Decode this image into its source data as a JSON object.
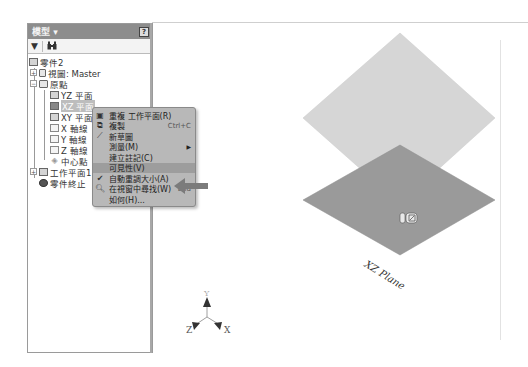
{
  "panel": {
    "title": "模型 ▾",
    "help_icon": "?",
    "toolbar": {
      "filter_icon": "▼",
      "search_icon": "binoculars"
    }
  },
  "tree": {
    "root": "零件2",
    "view": "視圖: Master",
    "origin": "原點",
    "yz_plane": "YZ 平面",
    "xz_plane": "XZ 平面",
    "xy_plane": "XY 平面",
    "x_axis": "X 軸線",
    "y_axis": "Y 軸線",
    "z_axis": "Z 軸線",
    "center_point": "中心點",
    "work_plane": "工作平面1",
    "end_of_part": "零件終止"
  },
  "context_menu": {
    "items": [
      {
        "label": "重複 工作平面(R)",
        "icon": "repeat-icon",
        "shortcut": ""
      },
      {
        "label": "複製",
        "icon": "copy-icon",
        "shortcut": "Ctrl+C"
      },
      {
        "label": "新草圖",
        "icon": "sketch-icon",
        "shortcut": ""
      },
      {
        "label": "測量(M)",
        "icon": "",
        "shortcut": "",
        "submenu": true
      },
      {
        "label": "建立註記(C)",
        "icon": "",
        "shortcut": ""
      },
      {
        "label": "可見性(V)",
        "icon": "",
        "shortcut": "",
        "highlighted": true
      },
      {
        "label": "自動重調大小(A)",
        "icon": "check-icon",
        "shortcut": "",
        "checked": true
      },
      {
        "label": "在視窗中尋找(W)",
        "icon": "find-icon",
        "shortcut": "End"
      },
      {
        "label": "如何(H)...",
        "icon": "",
        "shortcut": ""
      }
    ]
  },
  "viewport": {
    "plane_label": "XZ Plane",
    "triad": {
      "x": "X",
      "y": "Y",
      "z": "Z"
    }
  },
  "colors": {
    "upper_plane": "#d6d6d6",
    "lower_plane": "#9a9a9a",
    "menu_bg": "#b8b8b8",
    "header_bg": "#8d8d8d"
  }
}
